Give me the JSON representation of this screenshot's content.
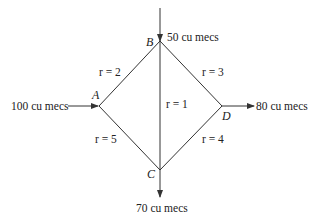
{
  "diagram": {
    "type": "flow-network",
    "nodes": [
      {
        "id": "A",
        "label": "A",
        "x": 99,
        "y": 106
      },
      {
        "id": "B",
        "label": "B",
        "x": 160,
        "y": 41
      },
      {
        "id": "C",
        "label": "C",
        "x": 160,
        "y": 170
      },
      {
        "id": "D",
        "label": "D",
        "x": 222,
        "y": 106
      }
    ],
    "edges": [
      {
        "from": "A",
        "to": "B",
        "label": "r = 2"
      },
      {
        "from": "B",
        "to": "D",
        "label": "r = 3"
      },
      {
        "from": "B",
        "to": "C",
        "label": "r = 1"
      },
      {
        "from": "A",
        "to": "C",
        "label": "r = 5"
      },
      {
        "from": "C",
        "to": "D",
        "label": "r = 4"
      }
    ],
    "flows": [
      {
        "node": "A",
        "direction": "in",
        "label": "100 cu mecs"
      },
      {
        "node": "B",
        "direction": "in",
        "label": "50 cu mecs"
      },
      {
        "node": "D",
        "direction": "out",
        "label": "80 cu mecs"
      },
      {
        "node": "C",
        "direction": "out",
        "label": "70 cu mecs"
      }
    ]
  }
}
